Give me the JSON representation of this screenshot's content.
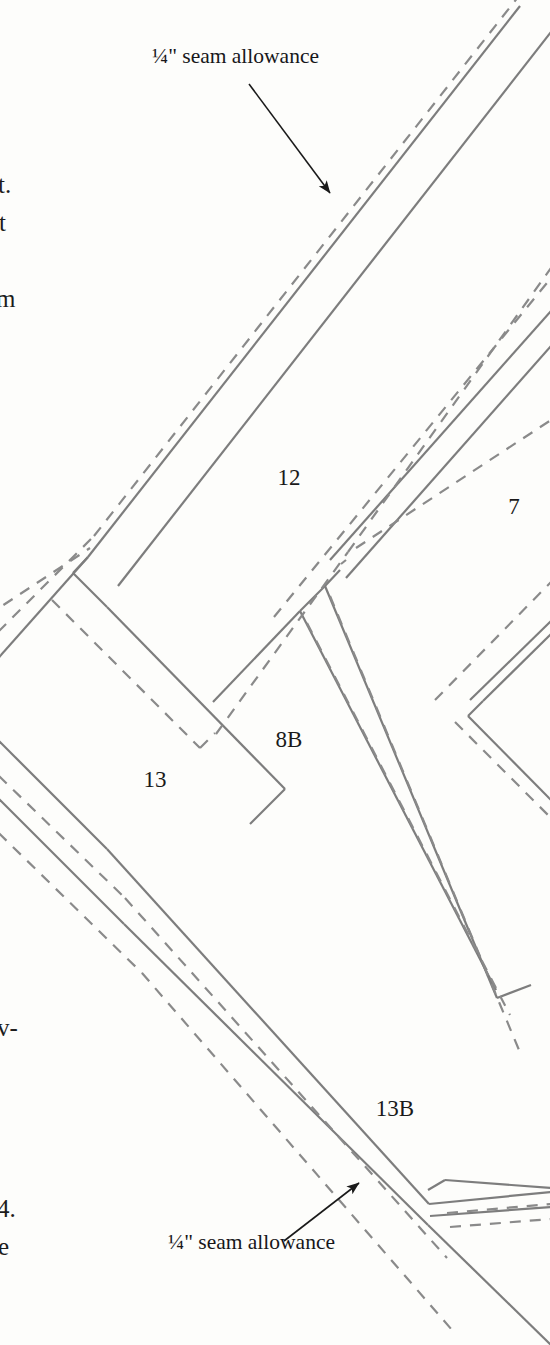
{
  "page": {
    "width": 550,
    "height": 1345,
    "background_color": "#fdfdfb",
    "line_color": "#7d7d7d",
    "text_color": "#1a1a1a"
  },
  "callouts": [
    {
      "id": "seam-allowance-top",
      "text": "¼\" seam allowance",
      "x": 152,
      "y": 46,
      "arrow": {
        "x1": 249,
        "y1": 84,
        "x2": 330,
        "y2": 193
      }
    },
    {
      "id": "seam-allowance-bottom",
      "text": "¼\" seam allowance",
      "x": 168,
      "y": 1232,
      "arrow": {
        "x1": 284,
        "y1": 1241,
        "x2": 359,
        "y2": 1183
      }
    }
  ],
  "piece_labels": [
    {
      "id": "piece-12",
      "text": "12",
      "x": 289,
      "y": 477
    },
    {
      "id": "piece-7",
      "text": "7",
      "x": 514,
      "y": 506
    },
    {
      "id": "piece-8b",
      "text": "8B",
      "x": 289,
      "y": 739
    },
    {
      "id": "piece-13",
      "text": "13",
      "x": 155,
      "y": 779
    },
    {
      "id": "piece-13b",
      "text": "13B",
      "x": 395,
      "y": 1108
    }
  ],
  "margin_text_fragments": [
    {
      "id": "fragment-t-period",
      "text": "t.",
      "x": -2,
      "y": 172
    },
    {
      "id": "fragment-t",
      "text": "t",
      "x": -1,
      "y": 210
    },
    {
      "id": "fragment-m",
      "text": "m",
      "x": -4,
      "y": 286
    },
    {
      "id": "fragment-v-dash",
      "text": "v-",
      "x": -3,
      "y": 1015
    },
    {
      "id": "fragment-4-period",
      "text": "4.",
      "x": -3,
      "y": 1196
    },
    {
      "id": "fragment-e",
      "text": "e",
      "x": -2,
      "y": 1234
    }
  ],
  "legend": {
    "solid_line_meaning": "finished stitching line",
    "dashed_line_meaning": "¼\" seam allowance cutting line"
  },
  "geometry": {
    "solid_lines": [
      [
        -30,
        690,
        88,
        557
      ],
      [
        88,
        557,
        73,
        573
      ],
      [
        73,
        573,
        107,
        607
      ],
      [
        107,
        607,
        285,
        789
      ],
      [
        285,
        789,
        250,
        824
      ],
      [
        88,
        557,
        520,
        6
      ],
      [
        73,
        573,
        74,
        574
      ],
      [
        118,
        586,
        551,
        32
      ],
      [
        340,
        570,
        325,
        586
      ],
      [
        325,
        586,
        300,
        611
      ],
      [
        300,
        611,
        213,
        702
      ],
      [
        330,
        560,
        551,
        311
      ],
      [
        346,
        578,
        551,
        346
      ],
      [
        300,
        611,
        496,
        990
      ],
      [
        325,
        586,
        497,
        998
      ],
      [
        497,
        998,
        531,
        985
      ],
      [
        470,
        700,
        551,
        621
      ],
      [
        468,
        716,
        483,
        701
      ],
      [
        483,
        701,
        551,
        634
      ],
      [
        468,
        716,
        551,
        800
      ],
      [
        -30,
        712,
        107,
        849
      ],
      [
        -30,
        770,
        124,
        924
      ],
      [
        107,
        849,
        429,
        1204
      ],
      [
        124,
        924,
        428,
        1225
      ],
      [
        428,
        1225,
        551,
        1345
      ],
      [
        429,
        1204,
        551,
        1192
      ],
      [
        430,
        1216,
        551,
        1207
      ],
      [
        428,
        1190,
        445,
        1180
      ],
      [
        445,
        1180,
        551,
        1188
      ]
    ],
    "dashed_lines": [
      [
        -30,
        660,
        94,
        536
      ],
      [
        94,
        536,
        533,
        -22
      ],
      [
        -30,
        627,
        90,
        548
      ],
      [
        52,
        600,
        200,
        748
      ],
      [
        200,
        748,
        215,
        733
      ],
      [
        216,
        734,
        348,
        552
      ],
      [
        348,
        552,
        551,
        268
      ],
      [
        274,
        617,
        551,
        278
      ],
      [
        356,
        548,
        551,
        420
      ],
      [
        341,
        564,
        346,
        560
      ],
      [
        330,
        596,
        519,
        1050
      ],
      [
        307,
        623,
        510,
        1015
      ],
      [
        435,
        700,
        551,
        582
      ],
      [
        455,
        722,
        551,
        818
      ],
      [
        -30,
        748,
        125,
        898
      ],
      [
        -30,
        805,
        142,
        973
      ],
      [
        125,
        898,
        447,
        1258
      ],
      [
        142,
        973,
        452,
        1330
      ],
      [
        447,
        1213,
        551,
        1204
      ],
      [
        450,
        1227,
        551,
        1219
      ]
    ]
  }
}
